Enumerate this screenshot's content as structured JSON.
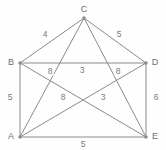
{
  "figure": {
    "background_color": "#fefefe",
    "line_color": "#8a8a8a",
    "label_color": "#6e6e6e",
    "weight_color": "#7a7a7a",
    "width": 166,
    "height": 150
  },
  "chart_data": {
    "type": "diagram",
    "subtype": "weighted-undirected-graph",
    "title": "",
    "nodes": [
      {
        "id": "A",
        "label": "A",
        "x": 20,
        "y": 137,
        "label_x": 11,
        "label_y": 136
      },
      {
        "id": "B",
        "label": "B",
        "x": 20,
        "y": 63,
        "label_x": 11,
        "label_y": 62
      },
      {
        "id": "C",
        "label": "C",
        "x": 84,
        "y": 18,
        "label_x": 84,
        "label_y": 9
      },
      {
        "id": "D",
        "label": "D",
        "x": 146,
        "y": 63,
        "label_x": 155,
        "label_y": 62
      },
      {
        "id": "E",
        "label": "E",
        "x": 146,
        "y": 137,
        "label_x": 155,
        "label_y": 136
      }
    ],
    "edges": [
      {
        "from": "B",
        "to": "C",
        "weight": 4,
        "label_x": 45,
        "label_y": 34
      },
      {
        "from": "C",
        "to": "D",
        "weight": 5,
        "label_x": 119,
        "label_y": 34
      },
      {
        "from": "B",
        "to": "D",
        "weight": 3,
        "label_x": 82,
        "label_y": 70
      },
      {
        "from": "B",
        "to": "A",
        "weight": 5,
        "label_x": 10,
        "label_y": 97
      },
      {
        "from": "D",
        "to": "E",
        "weight": 6,
        "label_x": 156,
        "label_y": 97
      },
      {
        "from": "A",
        "to": "E",
        "weight": 5,
        "label_x": 83,
        "label_y": 144
      },
      {
        "from": "B",
        "to": "E",
        "weight": 8,
        "label_x": 50,
        "label_y": 71
      },
      {
        "from": "C",
        "to": "A",
        "weight": 8,
        "label_x": 63,
        "label_y": 97
      },
      {
        "from": "C",
        "to": "E",
        "weight": 3,
        "label_x": 103,
        "label_y": 97
      },
      {
        "from": "A",
        "to": "D",
        "weight": 8,
        "label_x": 118,
        "label_y": 71
      }
    ],
    "node_count": 5,
    "edge_count": 10
  }
}
